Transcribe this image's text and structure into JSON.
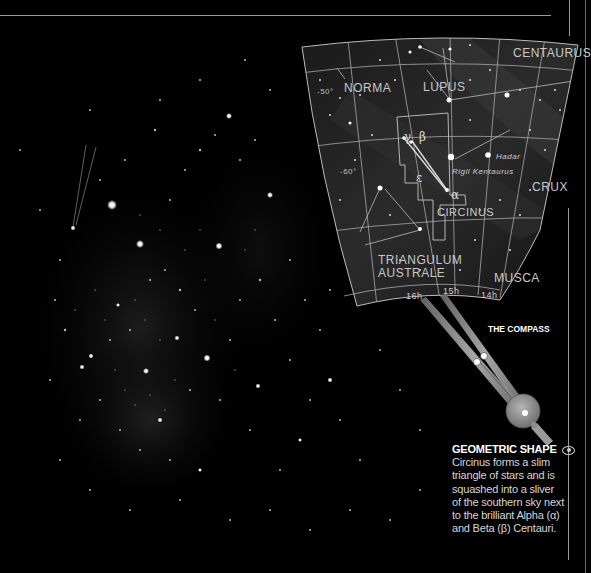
{
  "starmap": {
    "constellations": [
      {
        "id": "centaurus",
        "label": "CENTAURUS"
      },
      {
        "id": "norma",
        "label": "NORMA"
      },
      {
        "id": "lupus",
        "label": "LUPUS"
      },
      {
        "id": "crux",
        "label": "CRUX"
      },
      {
        "id": "circinus",
        "label": "CIRCINUS"
      },
      {
        "id": "triangulum-australe",
        "label": "TRIANGULUM\nAUSTRALE"
      },
      {
        "id": "musca",
        "label": "MUSCA"
      }
    ],
    "labels": {
      "centaurus": "CENTAURUS",
      "norma": "NORMA",
      "lupus": "LUPUS",
      "crux": "CRUX",
      "circinus": "CIRCINUS",
      "triangulum_line1": "TRIANGULUM",
      "triangulum_line2": "AUSTRALE",
      "musca": "MUSCA"
    },
    "stars": {
      "hadar": "Hadar",
      "rigil_kentaurus": "Rigil Kentaurus"
    },
    "greek": {
      "gamma": "γ",
      "beta": "β",
      "epsilon": "ε",
      "alpha": "α"
    },
    "declination": {
      "dec_50": "-50°",
      "dec_60": "-60°"
    },
    "right_ascension": {
      "ra_16": "16h",
      "ra_15": "15h",
      "ra_14": "14h"
    }
  },
  "compass": {
    "label": "THE COMPASS"
  },
  "caption": {
    "title": "GEOMETRIC SHAPE",
    "icon": "eye-icon",
    "body": "Circinus forms a slim triangle of stars and is squashed into a sliver of the southern sky next to the brilliant Alpha (α) and Beta (β) Centauri."
  },
  "colors": {
    "background": "#000000",
    "rule": "#9a9a9a",
    "chart_fill": "#1a1a1a",
    "grid": "#a8a8a8",
    "text": "#d6d6d6"
  }
}
